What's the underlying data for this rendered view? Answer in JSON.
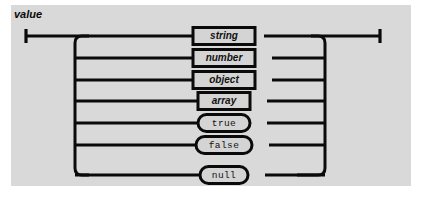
{
  "diagram": {
    "title": "value",
    "type": "railroad-syntax-diagram",
    "colors": {
      "page_background": "#ffffff",
      "panel_background": "#d9d9d9",
      "rail": "#0a0a0a",
      "node_fill": "#d4d4d4",
      "node_border": "#0a0a0a",
      "text": "#111111"
    },
    "alternatives": [
      {
        "label": "string",
        "kind": "nonterminal",
        "row": 0
      },
      {
        "label": "number",
        "kind": "nonterminal",
        "row": 1
      },
      {
        "label": "object",
        "kind": "nonterminal",
        "row": 2
      },
      {
        "label": "array",
        "kind": "nonterminal",
        "row": 3
      },
      {
        "label": "true",
        "kind": "terminal",
        "row": 4
      },
      {
        "label": "false",
        "kind": "terminal",
        "row": 5
      },
      {
        "label": "null",
        "kind": "terminal",
        "row": 6
      }
    ],
    "geometry": {
      "panel_x": 11,
      "panel_y": 5,
      "panel_w": 400,
      "panel_h": 181,
      "entry_x": 25,
      "exit_x": 379,
      "left_bus_x": 89,
      "right_bus_x": 325,
      "first_row_y": 36,
      "row_spacing": 21.5,
      "corner_radius": 7,
      "node_center_x": 222
    }
  }
}
